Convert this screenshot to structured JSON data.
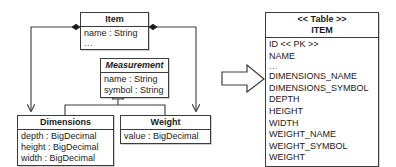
{
  "diagram": {
    "kind": "uml-class-to-relational-table-mapping",
    "transform_arrow": "block-arrow-right",
    "uml": {
      "classes": [
        {
          "id": "item",
          "name": "Item",
          "abstract": false,
          "attributes": [
            "name : String",
            "..."
          ]
        },
        {
          "id": "measurement",
          "name": "Measurement",
          "abstract": true,
          "attributes": [
            "name : String",
            "symbol : String"
          ]
        },
        {
          "id": "dimensions",
          "name": "Dimensions",
          "abstract": false,
          "attributes": [
            "depth : BigDecimal",
            "height : BigDecimal",
            "width : BigDecimal"
          ]
        },
        {
          "id": "weight",
          "name": "Weight",
          "abstract": false,
          "attributes": [
            "value : BigDecimal"
          ]
        }
      ],
      "relationships": [
        {
          "type": "composition",
          "from": "item",
          "to": "dimensions",
          "source_marker": "filled-diamond",
          "target_marker": "open-arrow"
        },
        {
          "type": "composition",
          "from": "item",
          "to": "weight",
          "source_marker": "filled-diamond",
          "target_marker": "open-arrow"
        },
        {
          "type": "generalization",
          "from": "dimensions",
          "to": "measurement",
          "target_marker": "hollow-triangle"
        },
        {
          "type": "generalization",
          "from": "weight",
          "to": "measurement",
          "target_marker": "hollow-triangle"
        }
      ]
    },
    "table": {
      "stereotype": "<< Table >>",
      "name": "ITEM",
      "columns": [
        "ID << PK >>",
        "NAME",
        "...",
        "DIMENSIONS_NAME",
        "DIMENSIONS_SYMBOL",
        "DEPTH",
        "HEIGHT",
        "WIDTH",
        "WEIGHT_NAME",
        "WEIGHT_SYMBOL",
        "WEIGHT"
      ]
    },
    "colors": {
      "stroke": "#3c3c3c",
      "fill": "#ffffff",
      "text": "#1a1a1a"
    }
  }
}
